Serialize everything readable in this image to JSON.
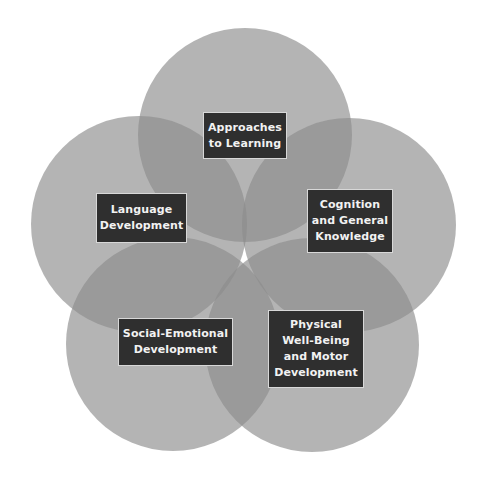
{
  "diagram": {
    "type": "five-circle overlapping venn (flower)",
    "colors": {
      "background": "#ffffff",
      "circle_fill": "#8c8c8c",
      "circle_opacity": 0.65,
      "label_box_fill": "#2f2f2f",
      "label_text": "#f2f2f2"
    },
    "circles": [
      {
        "id": "approaches",
        "cx": 245,
        "cy": 135,
        "r": 107
      },
      {
        "id": "cognition",
        "cx": 349,
        "cy": 225,
        "r": 107
      },
      {
        "id": "physical",
        "cx": 312,
        "cy": 345,
        "r": 107
      },
      {
        "id": "social",
        "cx": 173,
        "cy": 344,
        "r": 107
      },
      {
        "id": "language",
        "cx": 139,
        "cy": 224,
        "r": 108
      }
    ],
    "labels": {
      "approaches": "Approaches\nto Learning",
      "cognition": "Cognition\nand General\nKnowledge",
      "physical": "Physical\nWell-Being\nand Motor\nDevelopment",
      "social": "Social-Emotional\nDevelopment",
      "language": "Language\nDevelopment"
    }
  }
}
